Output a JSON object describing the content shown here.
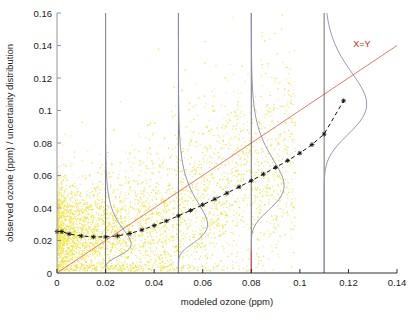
{
  "figure": {
    "background_color": "#ffffff",
    "plot_area": {
      "left": 57,
      "top": 13,
      "right": 397,
      "bottom": 273
    }
  },
  "chart_data": {
    "type": "scatter",
    "title": "",
    "xlabel": "modeled ozone (ppm)",
    "ylabel": "observed ozone (ppm) / uncertainty distribution",
    "xlim": [
      0,
      0.14
    ],
    "ylim": [
      0,
      0.16
    ],
    "xticks": [
      0,
      0.02,
      0.04,
      0.06,
      0.08,
      0.1,
      0.12,
      0.14
    ],
    "xtick_labels": [
      "0",
      "0.02",
      "0.04",
      "0.06",
      "0.08",
      "0.1",
      "0.12",
      "0.14"
    ],
    "yticks": [
      0,
      0.02,
      0.04,
      0.06,
      0.08,
      0.1,
      0.12,
      0.14,
      0.16
    ],
    "ytick_labels": [
      "0",
      "0.02",
      "0.04",
      "0.06",
      "0.08",
      "0.1",
      "0.12",
      "0.14",
      "0.16"
    ],
    "grid": false,
    "legend_position": "none",
    "series": [
      {
        "name": "observations",
        "type": "scatter",
        "color": "#f2e544",
        "marker": "dot",
        "marker_size": 1.2,
        "point_count": 5200,
        "description": "dense yellow cloud of observed vs modeled ozone pairs, concentrated between x=0 and x=0.08, y=0 and y=0.06, thinning upward to y=0.12 and rightward to x=0.09"
      },
      {
        "name": "X=Y",
        "type": "line",
        "color": "#e8796b",
        "label": "X=Y",
        "label_position": {
          "x": 0.122,
          "y": 0.139
        },
        "x": [
          0,
          0.14
        ],
        "y": [
          0,
          0.14
        ]
      },
      {
        "name": "mean observed vs modeled",
        "type": "line",
        "color": "#111111",
        "style": "dashed",
        "marker": "star",
        "x": [
          0.0,
          0.002,
          0.005,
          0.01,
          0.015,
          0.02,
          0.025,
          0.03,
          0.035,
          0.04,
          0.045,
          0.05,
          0.055,
          0.06,
          0.065,
          0.07,
          0.075,
          0.08,
          0.085,
          0.09,
          0.095,
          0.1,
          0.105,
          0.11,
          0.118
        ],
        "y": [
          0.0255,
          0.0255,
          0.024,
          0.0228,
          0.0222,
          0.0222,
          0.0228,
          0.0243,
          0.0265,
          0.0292,
          0.032,
          0.0352,
          0.0385,
          0.042,
          0.0455,
          0.0492,
          0.053,
          0.0568,
          0.0608,
          0.065,
          0.0692,
          0.0738,
          0.079,
          0.0855,
          0.106
        ]
      }
    ],
    "distributions": [
      {
        "name": "uncertainty-distribution-0.02",
        "at_x": 0.02,
        "color": "#8b90b8",
        "axis_color": "#4a4a4a",
        "peak_y": 0.0225,
        "peak_width": 0.0105,
        "spread": 0.0115,
        "description": "vertical uncertainty distribution drawn sideways at modeled ozone = 0.02 ppm, peaking near observed 0.022 ppm"
      },
      {
        "name": "uncertainty-distribution-0.05",
        "at_x": 0.05,
        "color": "#8b90b8",
        "axis_color": "#4a4a4a",
        "peak_y": 0.0355,
        "peak_width": 0.012,
        "spread": 0.016,
        "description": "vertical uncertainty distribution at modeled ozone = 0.05 ppm, peaking near observed 0.036 ppm"
      },
      {
        "name": "uncertainty-distribution-0.08",
        "at_x": 0.08,
        "color": "#8b90b8",
        "axis_color": "#4a4a4a",
        "peak_y": 0.0585,
        "peak_width": 0.0135,
        "spread": 0.0185,
        "description": "vertical uncertainty distribution at modeled ozone = 0.08 ppm, peaking near observed 0.059 ppm, with short red segment at the base"
      },
      {
        "name": "uncertainty-distribution-0.11",
        "at_x": 0.11,
        "color": "#8b90b8",
        "axis_color": "#4a4a4a",
        "peak_y": 0.1075,
        "peak_width": 0.0175,
        "spread": 0.0215,
        "description": "vertical uncertainty distribution at modeled ozone = 0.11 ppm, peaking near observed 0.108 ppm"
      }
    ],
    "annotations": [
      {
        "text": "X=Y",
        "x": 0.122,
        "y": 0.139,
        "color": "#cc2222"
      }
    ]
  }
}
